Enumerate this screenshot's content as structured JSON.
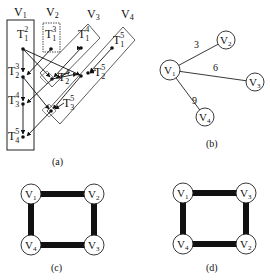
{
  "panel_a": {
    "caption": "(a)",
    "groups": [
      {
        "id": "V1",
        "label": "V",
        "sub": "1"
      },
      {
        "id": "V2",
        "label": "V",
        "sub": "2"
      },
      {
        "id": "V3",
        "label": "V",
        "sub": "3"
      },
      {
        "id": "V4",
        "label": "V",
        "sub": "4"
      }
    ],
    "tasks": [
      {
        "id": "T1_2",
        "base": "T",
        "sub": "1",
        "sup": "2"
      },
      {
        "id": "T1_3",
        "base": "T",
        "sub": "1",
        "sup": "3"
      },
      {
        "id": "T1_4",
        "base": "T",
        "sub": "1",
        "sup": "4"
      },
      {
        "id": "T1_5",
        "base": "T",
        "sub": "1",
        "sup": "5"
      },
      {
        "id": "T2_3",
        "base": "T",
        "sub": "2",
        "sup": "3"
      },
      {
        "id": "T2_4",
        "base": "T",
        "sub": "2",
        "sup": "4"
      },
      {
        "id": "T2_5",
        "base": "T",
        "sub": "2",
        "sup": "5"
      },
      {
        "id": "T3_4",
        "base": "T",
        "sub": "3",
        "sup": "4"
      },
      {
        "id": "T3_5",
        "base": "T",
        "sub": "3",
        "sup": "5"
      },
      {
        "id": "T4_5",
        "base": "T",
        "sub": "4",
        "sup": "5"
      }
    ]
  },
  "panel_b": {
    "caption": "(b)",
    "nodes": [
      {
        "label": "V",
        "sub": "1"
      },
      {
        "label": "V",
        "sub": "2"
      },
      {
        "label": "V",
        "sub": "3"
      },
      {
        "label": "V",
        "sub": "4"
      }
    ],
    "edges": [
      {
        "from": "V1",
        "to": "V2",
        "weight": "3"
      },
      {
        "from": "V1",
        "to": "V3",
        "weight": "6"
      },
      {
        "from": "V1",
        "to": "V4",
        "weight": "9"
      }
    ]
  },
  "panel_c": {
    "caption": "(c)",
    "nodes": [
      {
        "label": "V",
        "sub": "1"
      },
      {
        "label": "V",
        "sub": "2"
      },
      {
        "label": "V",
        "sub": "3"
      },
      {
        "label": "V",
        "sub": "4"
      }
    ]
  },
  "panel_d": {
    "caption": "(d)",
    "nodes": [
      {
        "label": "V",
        "sub": "1"
      },
      {
        "label": "V",
        "sub": "3"
      },
      {
        "label": "V",
        "sub": "2"
      },
      {
        "label": "V",
        "sub": "4"
      }
    ]
  }
}
